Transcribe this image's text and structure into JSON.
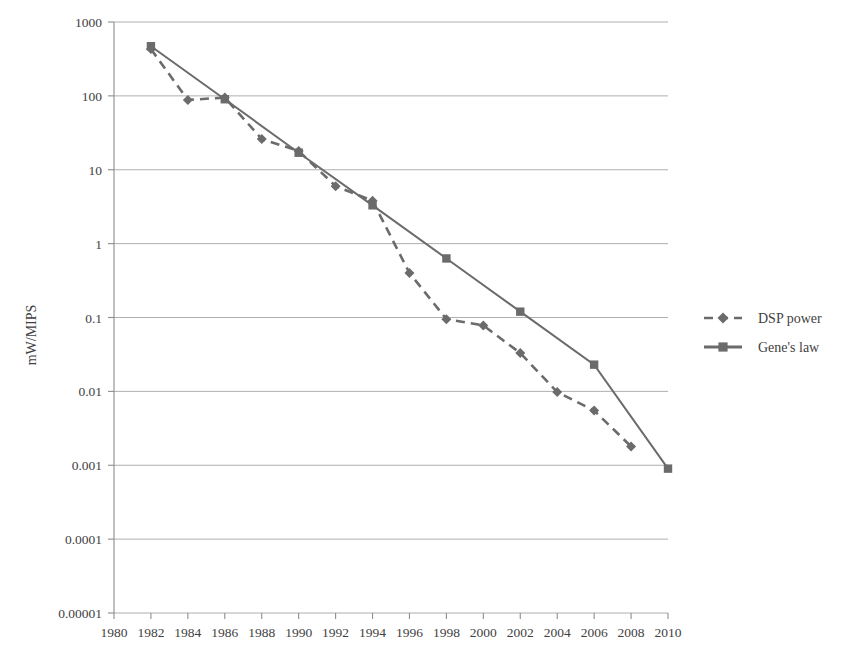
{
  "chart_data": {
    "type": "line",
    "title": "",
    "xlabel": "",
    "ylabel": "mW/MIPS",
    "yscale": "log",
    "ylim": [
      1e-05,
      1000
    ],
    "xlim": [
      1980,
      2010
    ],
    "grid": true,
    "legend_position": "right",
    "x_tick_labels": [
      "1980",
      "1982",
      "1984",
      "1986",
      "1988",
      "1990",
      "1992",
      "1994",
      "1996",
      "1998",
      "2000",
      "2002",
      "2004",
      "2006",
      "2008",
      "2010"
    ],
    "y_tick_labels": [
      "1000",
      "100",
      "10",
      "1",
      "0.1",
      "0.01",
      "0.001",
      "0.0001",
      "0.00001"
    ],
    "y_tick_values": [
      1000,
      100,
      10,
      1,
      0.1,
      0.01,
      0.001,
      0.0001,
      1e-05
    ],
    "series": [
      {
        "name": "DSP power",
        "style": "dashed",
        "marker": "diamond",
        "color": "#6b6b6b",
        "x": [
          1982,
          1984,
          1986,
          1988,
          1990,
          1992,
          1994,
          1996,
          1998,
          2000,
          2002,
          2004,
          2006,
          2008
        ],
        "values": [
          430,
          88,
          95,
          26,
          18,
          6,
          3.8,
          0.4,
          0.095,
          0.078,
          0.033,
          0.0098,
          0.0055,
          0.0018
        ]
      },
      {
        "name": "Gene's law",
        "style": "solid",
        "marker": "square",
        "color": "#6b6b6b",
        "x": [
          1982,
          1986,
          1990,
          1994,
          1998,
          2002,
          2006,
          2010
        ],
        "values": [
          470,
          90,
          17,
          3.3,
          0.63,
          0.12,
          0.023,
          0.0009
        ]
      }
    ]
  },
  "legend": {
    "items": [
      {
        "label": "DSP power",
        "style": "dashed",
        "marker": "diamond"
      },
      {
        "label": "Gene's law",
        "style": "solid",
        "marker": "square"
      }
    ]
  },
  "colors": {
    "line": "#6b6b6b",
    "grid": "#9a9a9a",
    "axis": "#8d8d8d",
    "text": "#3f3f3f",
    "background": "#ffffff"
  }
}
